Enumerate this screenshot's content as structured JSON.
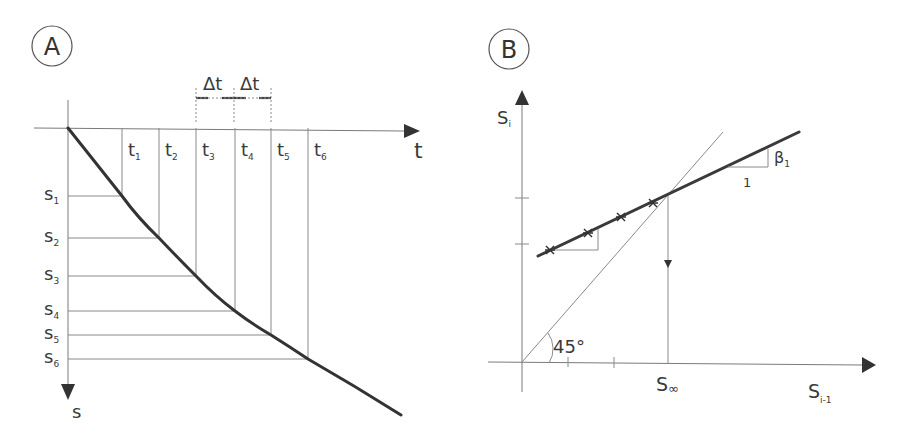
{
  "panel_a": {
    "badge": "A",
    "x_axis_label": "t",
    "y_axis_label": "s",
    "delta_labels": [
      "Δt",
      "Δt"
    ],
    "time_labels": [
      {
        "base": "t",
        "sub": "1"
      },
      {
        "base": "t",
        "sub": "2"
      },
      {
        "base": "t",
        "sub": "3"
      },
      {
        "base": "t",
        "sub": "4"
      },
      {
        "base": "t",
        "sub": "5"
      },
      {
        "base": "t",
        "sub": "6"
      }
    ],
    "settlement_labels": [
      {
        "base": "s",
        "sub": "1"
      },
      {
        "base": "s",
        "sub": "2"
      },
      {
        "base": "s",
        "sub": "3"
      },
      {
        "base": "s",
        "sub": "4"
      },
      {
        "base": "s",
        "sub": "5"
      },
      {
        "base": "s",
        "sub": "6"
      }
    ],
    "description": "Settlement vs time curve with equal time intervals Δt; settlements s1..s6 read at times t1..t6"
  },
  "panel_b": {
    "badge": "B",
    "y_axis_label": {
      "base": "S",
      "sub": "i"
    },
    "x_axis_label": {
      "base": "S",
      "sub": "i-1"
    },
    "intersection_label": {
      "base": "S",
      "sub": "∞"
    },
    "angle_label": "45°",
    "slope_label": {
      "base": "β",
      "sub": "1"
    },
    "slope_run_label": "1",
    "data_point_count": 4,
    "description": "Asaoka plot: S_i vs S_(i-1) fitted line of slope β1 intersecting 45° line at S∞"
  }
}
